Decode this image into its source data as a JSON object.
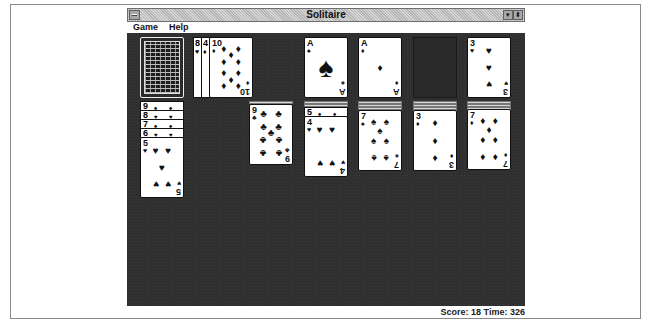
{
  "window": {
    "title": "Solitaire",
    "controls": {
      "minimize": "▾",
      "maximize": "⬍"
    }
  },
  "menu": {
    "items": [
      {
        "label": "Game",
        "accel": "G"
      },
      {
        "label": "Help",
        "accel": "H"
      }
    ]
  },
  "status": {
    "score_label": "Score:",
    "score": "18",
    "time_label": "Time:",
    "time": "326",
    "text": "Score: 18 Time: 326"
  },
  "stock": {
    "face": "down"
  },
  "waste": [
    {
      "rank": "8",
      "suit": "♥"
    },
    {
      "rank": "4",
      "suit": "♦"
    },
    {
      "rank": "10",
      "suit": "♦"
    }
  ],
  "foundations": [
    {
      "rank": "A",
      "suit": "♠"
    },
    {
      "rank": "A",
      "suit": "♦"
    },
    {
      "rank": "",
      "suit": ""
    },
    {
      "rank": "3",
      "suit": "♥"
    }
  ],
  "tableau": [
    {
      "face_down": 0,
      "overlaps": [
        {
          "rank": "9",
          "suit": "♠"
        },
        {
          "rank": "8",
          "suit": "♥"
        },
        {
          "rank": "7",
          "suit": "♠"
        },
        {
          "rank": "6",
          "suit": "♥"
        }
      ],
      "top": {
        "rank": "5",
        "suit": "♥"
      }
    },
    {
      "face_down": 0,
      "overlaps": [],
      "top": null
    },
    {
      "face_down": 1,
      "overlaps": [],
      "top": {
        "rank": "9",
        "suit": "♣"
      }
    },
    {
      "face_down": 2,
      "overlaps": [
        {
          "rank": "5",
          "suit": "♠"
        }
      ],
      "top": {
        "rank": "4",
        "suit": "♥"
      }
    },
    {
      "face_down": 3,
      "overlaps": [],
      "top": {
        "rank": "7",
        "suit": "♠"
      }
    },
    {
      "face_down": 4,
      "overlaps": [],
      "top": {
        "rank": "3",
        "suit": "♦"
      }
    },
    {
      "face_down": 5,
      "overlaps": [],
      "top": {
        "rank": "7",
        "suit": "♦"
      }
    }
  ],
  "colors": {
    "felt": "#2f2f2f",
    "card": "#ffffff",
    "titlebar": "#c8c8c8"
  }
}
